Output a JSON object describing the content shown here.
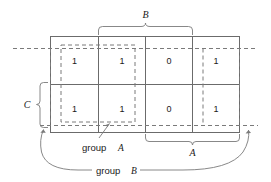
{
  "diagram": {
    "type": "karnaugh-map",
    "grid": {
      "rows": 2,
      "columns": 4,
      "cells": [
        [
          "1",
          "1",
          "0",
          "1"
        ],
        [
          "1",
          "1",
          "0",
          "1"
        ]
      ]
    },
    "axis_labels": {
      "top": "B",
      "left": "C",
      "bottom": "A"
    },
    "annotations": {
      "group_a_text": "group",
      "group_a_var": "A",
      "group_b_text": "group",
      "group_b_var": "B"
    },
    "colors": {
      "grid_line": "#6b6b6b",
      "dashed_group": "#7a7a7a",
      "text": "#1a1a1a",
      "background": "#ffffff"
    }
  }
}
